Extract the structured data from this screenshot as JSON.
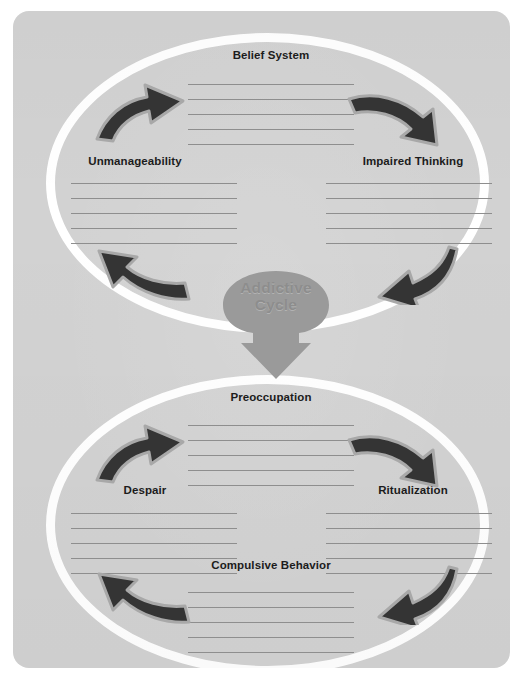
{
  "worksheet": {
    "title": "Addictive Cycle",
    "center_label_line1": "Addictive",
    "center_label_line2": "Cycle"
  },
  "colors": {
    "card_background": "#d2d2d2",
    "page_background": "#ffffff",
    "oval_ring": "#ffffff",
    "hub_fill": "#9a9a9a",
    "hub_text": "#8d8d8d",
    "arrow_fill": "#343434",
    "arrow_outline": "#a8a8a8",
    "heading_text": "#1c1c1c",
    "writing_line": "#8e8e8e"
  },
  "top_cycle": {
    "name": "belief-cycle",
    "sections": [
      {
        "id": "belief-system",
        "label": "Belief System",
        "lines": 5
      },
      {
        "id": "impaired-thinking",
        "label": "Impaired Thinking",
        "lines": 5
      },
      {
        "id": "unmanageability",
        "label": "Unmanageability",
        "lines": 5
      }
    ],
    "arrows": [
      {
        "id": "arrow-up-right",
        "direction": "up-right"
      },
      {
        "id": "arrow-down-right",
        "direction": "down-right"
      },
      {
        "id": "arrow-down-left",
        "direction": "down-left"
      },
      {
        "id": "arrow-up-left",
        "direction": "up-left"
      }
    ]
  },
  "bottom_cycle": {
    "name": "behavior-cycle",
    "sections": [
      {
        "id": "preoccupation",
        "label": "Preoccupation",
        "lines": 5
      },
      {
        "id": "ritualization",
        "label": "Ritualization",
        "lines": 5
      },
      {
        "id": "compulsive-behavior",
        "label": "Compulsive Behavior",
        "lines": 5
      },
      {
        "id": "despair",
        "label": "Despair",
        "lines": 5
      }
    ],
    "arrows": [
      {
        "id": "arrow-up-right",
        "direction": "up-right"
      },
      {
        "id": "arrow-down-right",
        "direction": "down-right"
      },
      {
        "id": "arrow-down-left",
        "direction": "down-left"
      },
      {
        "id": "arrow-up-left",
        "direction": "up-left"
      }
    ]
  },
  "connector": {
    "id": "downward-arrow",
    "from": "belief-cycle",
    "to": "behavior-cycle"
  }
}
